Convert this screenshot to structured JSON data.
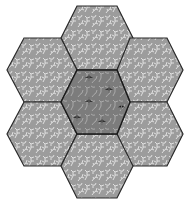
{
  "figure": {
    "background": "#ffffff",
    "outline_color": "#2a2a2a",
    "outer_fill": "#9c9c9c",
    "outer_pattern_color": "#e6e6e6",
    "center_fill": "#7c7c7c",
    "center_pattern_color": "#bdbdbd",
    "center_motif_color": "#1a1a1a",
    "hexagons": [
      {
        "id": "top",
        "role": "petal",
        "cx": 97,
        "cy": 38
      },
      {
        "id": "upper-left",
        "role": "petal",
        "cx": 43,
        "cy": 70
      },
      {
        "id": "upper-right",
        "role": "petal",
        "cx": 150,
        "cy": 70
      },
      {
        "id": "center",
        "role": "center",
        "cx": 97,
        "cy": 102
      },
      {
        "id": "lower-left",
        "role": "petal",
        "cx": 43,
        "cy": 134
      },
      {
        "id": "lower-right",
        "role": "petal",
        "cx": 150,
        "cy": 134
      },
      {
        "id": "bottom",
        "role": "petal",
        "cx": 97,
        "cy": 166
      }
    ]
  }
}
